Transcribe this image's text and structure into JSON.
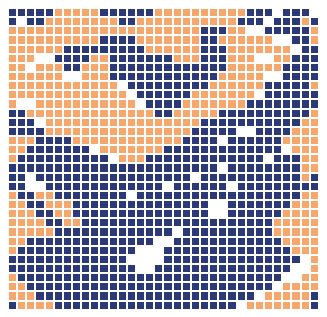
{
  "artwork": {
    "title": "abstract pixel mosaic",
    "kind": "pixel-grid-mosaic",
    "background_color": "#ffffff"
  },
  "grid": {
    "columns": 34,
    "rows": 33,
    "cell_size_px": 9.15,
    "offset_x_px": 8,
    "offset_y_px": 8,
    "gridline_color": "#ffffff"
  },
  "palette": {
    "n": "#2b3a77",
    "o": "#f5a76c",
    "w": "#ffffff"
  },
  "legend": [
    {
      "key": "n",
      "name": "navy",
      "hex": "#2b3a77"
    },
    {
      "key": "o",
      "name": "orange",
      "hex": "#f5a76c"
    },
    {
      "key": "w",
      "name": "white",
      "hex": "#ffffff"
    }
  ],
  "rows": [
    "nnnnnooooonnnnnnoooooooooonnnwnnnw",
    "nwnnoooooooonnooooooooooonnnwnnnon",
    "ooooooooooooooooooooonnnoowwnnnnno",
    "oooooooooonnnnooooooonnoooooowwnno",
    "oooooonnnnnnnnnoooooonnnooooooownn",
    "ooowwnnnnoonnnnnnnooonnnooowwoonnn",
    "oowooonnooonnnnnnnnnnnnnoooooonnnn",
    "oooooowwooonnnnnnnnnnnnooooowwnnnn",
    "oooooooooooownnnnnnnnnoooooonnnnno",
    "ooooooooooooownnnnnnooooooownnnnnn",
    "owwooooooooooownnnnooooooonnnnnnnn",
    "nnoooooooooooooonnooooonnnnnnnnnno",
    "nnnwooooooooooooooooonnnnnnnnnnnoo",
    "nnnnoooooooooooooooonnnnnwwnnnnooo",
    "ooonnnnoooooooooooonnnnwnnnnnnoooo",
    "oonnnnnnnwooooooonnnnnnnnnnnnnwooo",
    "onnnnnnnnnnwooonnnnnnnnnnnnnwnnnoo",
    "nnnnnnnnnnnnnnnnnnnnnnnwnnnnnnnnoo",
    "nnwnnnnnnnnnnnnnnnnnwnnnnnnnnnnnon",
    "nnwwnnnnnnnnnnnnnwnnnnnnwnnnnnnnnn",
    "onnoonnnnnnnnwnnnnnnnnnnnnnnnnnnoo",
    "oonnooonnnnnnnnnnnnnnnwwnnnnnnnooo",
    "ooonnoonnnnnnnnnnnnnnnwwnnnnnnoooo",
    "oooonnoonnnnnnnnnnnnnnnnnnnnnooooo",
    "ooooonnnnnnnnnnnnnwnnnnnnnnnnooooo",
    "oonnnnnnnnnnnnnnwwnnnnnnnnnnnnoooo",
    "onnnnnnnnnnnnnwwwnnnnnnnnnnnnnnooo",
    "nnnnnnnnnnnnnwwwwnnnnnnnnnnnnnnnwo",
    "nnnnnnnnnnnnnnwwnnnnnnnnnnnnnnnwwo",
    "onnnnnnnnnnnnnnnnnnnnnnnnnnnnnwwoo",
    "oonnnnnnnnnnnnnnnnnnnnnnnnnnnwoooo",
    "ooonnnnnnnnnnnnnnnnnnnnnnnnwooooon",
    "noooonnnnnnnnnnnnnnnnnnnnwooooooon"
  ]
}
